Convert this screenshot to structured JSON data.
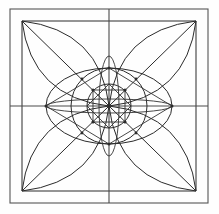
{
  "figure": {
    "width": 219,
    "height": 214,
    "background_color": "#fefefe",
    "line_color": "#2b2b2b",
    "frame_color": "#555555",
    "axis_color": "#4a4a4a"
  },
  "geometry": {
    "outer_square": {
      "left": 10,
      "top": 9,
      "right": 208,
      "bottom": 203
    },
    "inner_square": {
      "left": 22,
      "top": 21,
      "right": 196,
      "bottom": 191
    },
    "center": {
      "x": 109,
      "y": 106
    },
    "circles": [
      {
        "name": "inner-circle",
        "cx": 109,
        "cy": 106,
        "r": 22
      },
      {
        "name": "outer-circle",
        "cx": 109,
        "cy": 106,
        "r": 38
      }
    ],
    "ellipses": [
      {
        "name": "wide-ellipse",
        "cx": 109,
        "cy": 106,
        "rx": 63,
        "ry": 38
      },
      {
        "name": "tall-lens-ellipse",
        "cx": 109,
        "cy": 106,
        "rx": 10,
        "ry": 50
      },
      {
        "name": "flat-lens-ellipse",
        "cx": 109,
        "cy": 106,
        "rx": 63,
        "ry": 7
      }
    ],
    "axes": {
      "horizontal": {
        "x1": 10,
        "y1": 106,
        "x2": 208,
        "y2": 106
      },
      "vertical": {
        "x1": 109,
        "y1": 9,
        "x2": 109,
        "y2": 203
      }
    },
    "diagonals": [
      {
        "name": "diagonal-tl-br",
        "x1": 22,
        "y1": 21,
        "x2": 196,
        "y2": 191
      },
      {
        "name": "diagonal-tr-bl",
        "x1": 196,
        "y1": 21,
        "x2": 22,
        "y2": 191
      }
    ],
    "petal_arcs": [
      {
        "name": "petal-arc-top-left",
        "from": [
          22,
          21
        ],
        "to": [
          109,
          106
        ]
      },
      {
        "name": "petal-arc-top-right",
        "from": [
          196,
          21
        ],
        "to": [
          109,
          106
        ]
      },
      {
        "name": "petal-arc-bottom-left",
        "from": [
          22,
          191
        ],
        "to": [
          109,
          106
        ]
      },
      {
        "name": "petal-arc-bottom-right",
        "from": [
          196,
          191
        ],
        "to": [
          109,
          106
        ]
      }
    ],
    "node_points": [
      {
        "name": "node-center",
        "x": 109,
        "y": 106
      },
      {
        "name": "node-up",
        "x": 109,
        "y": 68
      },
      {
        "name": "node-down",
        "x": 109,
        "y": 144
      },
      {
        "name": "node-left",
        "x": 46,
        "y": 106
      },
      {
        "name": "node-right",
        "x": 172,
        "y": 106
      },
      {
        "name": "node-inner-up",
        "x": 109,
        "y": 84
      },
      {
        "name": "node-inner-down",
        "x": 109,
        "y": 128
      },
      {
        "name": "node-inner-left",
        "x": 87,
        "y": 106
      },
      {
        "name": "node-inner-right",
        "x": 131,
        "y": 106
      },
      {
        "name": "node-diag-tl",
        "x": 93,
        "y": 90
      },
      {
        "name": "node-diag-tr",
        "x": 125,
        "y": 90
      },
      {
        "name": "node-diag-bl",
        "x": 93,
        "y": 122
      },
      {
        "name": "node-diag-br",
        "x": 125,
        "y": 122
      },
      {
        "name": "node-ring-tl",
        "x": 82,
        "y": 79
      },
      {
        "name": "node-ring-tr",
        "x": 136,
        "y": 79
      },
      {
        "name": "node-ring-bl",
        "x": 82,
        "y": 133
      },
      {
        "name": "node-ring-br",
        "x": 136,
        "y": 133
      }
    ]
  }
}
